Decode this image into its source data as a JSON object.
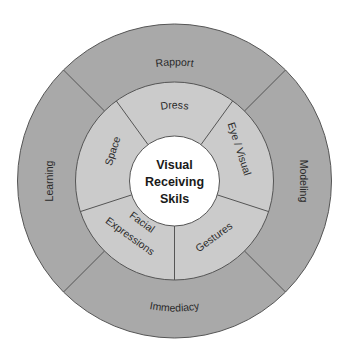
{
  "diagram": {
    "center": {
      "lines": [
        "Visual",
        "Receiving",
        "Skils"
      ]
    },
    "inner_ring": {
      "segments": [
        {
          "label": "Dress"
        },
        {
          "label": "Eye / Visual"
        },
        {
          "label": "Gestures"
        },
        {
          "label_line1": "Facial",
          "label_line2": "Expressions"
        },
        {
          "label": "Space"
        }
      ]
    },
    "outer_ring": {
      "segments": [
        {
          "label": "Rapport"
        },
        {
          "label": "Modeling"
        },
        {
          "label": "Immediacy"
        },
        {
          "label": "Learning"
        }
      ]
    },
    "colors": {
      "outer_fill": "#a9a9a9",
      "inner_fill": "#cbcbcb",
      "center_fill": "#ffffff",
      "line": "#555555"
    }
  }
}
